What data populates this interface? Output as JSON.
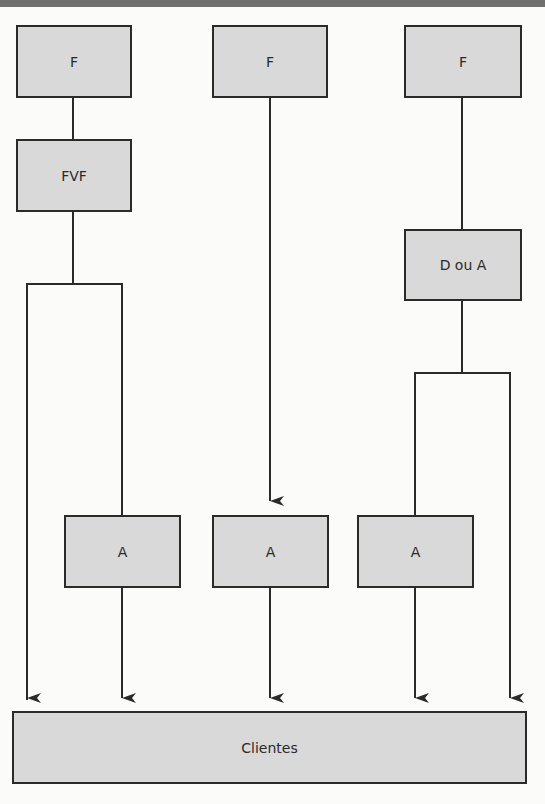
{
  "diagram": {
    "type": "flow-diagram",
    "colors": {
      "box_fill": "#d9d9d9",
      "box_border": "#2a2a2a",
      "line": "#2a2a2a",
      "top_band": "#6f6f6f"
    },
    "top_row": [
      {
        "id": "f1",
        "label": "F"
      },
      {
        "id": "f2",
        "label": "F"
      },
      {
        "id": "f3",
        "label": "F"
      }
    ],
    "intermediate": [
      {
        "id": "fvf",
        "label": "FVF"
      },
      {
        "id": "d_ou_a",
        "label": "D ou A"
      }
    ],
    "a_row": [
      {
        "id": "a1",
        "label": "A"
      },
      {
        "id": "a2",
        "label": "A"
      },
      {
        "id": "a3",
        "label": "A"
      }
    ],
    "bottom": {
      "id": "clientes",
      "label": "Clientes"
    },
    "edges": [
      [
        "f1",
        "fvf"
      ],
      [
        "fvf",
        "a1"
      ],
      [
        "fvf",
        "clientes"
      ],
      [
        "a1",
        "clientes"
      ],
      [
        "f2",
        "a2"
      ],
      [
        "a2",
        "clientes"
      ],
      [
        "f3",
        "d_ou_a"
      ],
      [
        "d_ou_a",
        "a3"
      ],
      [
        "d_ou_a",
        "clientes"
      ],
      [
        "a3",
        "clientes"
      ]
    ]
  }
}
